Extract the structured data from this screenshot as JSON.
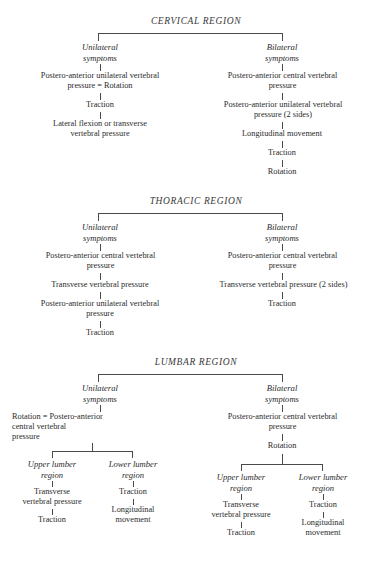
{
  "document": {
    "type": "clinical-treatment-flowchart",
    "ink_color": "#2b2b2b",
    "line_color": "#4a4a4a",
    "background": "#ffffff"
  },
  "regions": {
    "cervical": {
      "title": "CERVICAL REGION",
      "branches": {
        "unilateral": {
          "label": "Unilateral\nsymptoms",
          "steps": [
            "Postero-anterior unilateral vertebral\npressure = Rotation",
            "Traction",
            "Lateral flexion or transverse\nvertebral pressure"
          ]
        },
        "bilateral": {
          "label": "Bilateral\nsymptoms",
          "steps": [
            "Postero-anterior central vertebral\npressure",
            "Postero-anterior unilateral vertebral\npressure (2 sides)",
            "Longitudinal movement",
            "Traction",
            "Rotation"
          ]
        }
      }
    },
    "thoracic": {
      "title": "THORACIC REGION",
      "branches": {
        "unilateral": {
          "label": "Unilateral\nsymptoms",
          "steps": [
            "Postero-anterior central vertebral\npressure",
            "Transverse vertebral pressure",
            "Postero-anterior unilateral vertebral\npressure",
            "Traction"
          ]
        },
        "bilateral": {
          "label": "Bilateral\nsymptoms",
          "steps": [
            "Postero-anterior central vertebral\npressure",
            "Transverse vertebral pressure (2 sides)",
            "Traction"
          ]
        }
      }
    },
    "lumbar": {
      "title": "LUMBAR REGION",
      "branches": {
        "unilateral": {
          "label": "Unilateral\nsymptoms",
          "steps": [
            "Rotation = Postero-anterior\n    central vertebral\n    pressure"
          ],
          "sub_branches": {
            "upper": {
              "label": "Upper lumber\nregion",
              "steps": [
                "Transverse\nvertebral pressure",
                "Traction"
              ]
            },
            "lower": {
              "label": "Lower lumber\nregion",
              "steps": [
                "Traction",
                "Longitudinal\nmovement"
              ]
            }
          }
        },
        "bilateral": {
          "label": "Bilateral\nsymptoms",
          "steps": [
            "Postero-anterior central vertebral\npressure",
            "Rotation"
          ],
          "sub_branches": {
            "upper": {
              "label": "Upper lumber\nregion",
              "steps": [
                "Transverse\nvertebral pressure",
                "Traction"
              ]
            },
            "lower": {
              "label": "Lower lumber\nregion",
              "steps": [
                "Traction",
                "Longitudinal\nmovement"
              ]
            }
          }
        }
      }
    }
  }
}
